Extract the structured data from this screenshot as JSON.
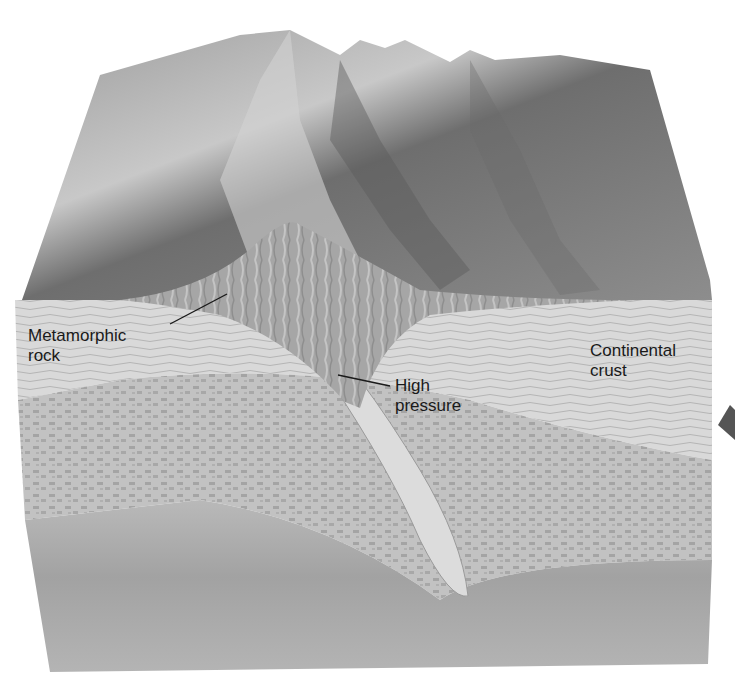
{
  "diagram": {
    "labels": {
      "metamorphic_rock": {
        "line1": "Metamorphic",
        "line2": "rock"
      },
      "high_pressure": {
        "line1": "High",
        "line2": "pressure"
      },
      "continental_crust": {
        "line1": "Continental",
        "line2": "crust"
      }
    },
    "colors": {
      "background": "#ffffff",
      "mountain_surface": "#8a8a8a",
      "metamorphic_wedge": "#9a9a9a",
      "crust_layer": "#d6d6d6",
      "mantle_mottled": "#b4b4b4",
      "deep_layer": "#a0a0a0",
      "label_text": "#1a1a1a"
    }
  }
}
